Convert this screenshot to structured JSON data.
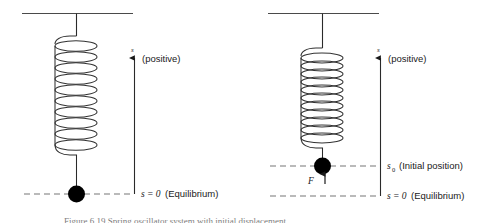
{
  "figure": {
    "background_color": "#ffffff",
    "line_color": "#1a1a1a",
    "spring_color": "#333333",
    "ceiling_color": "#555555",
    "dash_color": "#777777",
    "ball_color": "#000000",
    "caption": "Figure 6.19  Spring oscillator system with initial displacement"
  },
  "panels": [
    {
      "id": "left-panel",
      "name": "equilibrium-panel",
      "ceiling_label": "ceiling-support",
      "spring_state": "relaxed",
      "coil_count": 10,
      "axis": {
        "symbol": "s",
        "direction_label": "(positive)"
      },
      "reference_lines": [
        {
          "id": "equilibrium-line",
          "symbol": "s = 0",
          "description": "(Equilibrium)"
        }
      ],
      "mass": {
        "name": "mass-ball",
        "position": "equilibrium"
      },
      "force": null
    },
    {
      "id": "right-panel",
      "name": "displaced-panel",
      "ceiling_label": "ceiling-support",
      "spring_state": "compressed",
      "coil_count": 11,
      "axis": {
        "symbol": "s",
        "direction_label": "(positive)"
      },
      "reference_lines": [
        {
          "id": "initial-position-line",
          "symbol": "s",
          "subscript": "0",
          "description": "(Initial position)"
        },
        {
          "id": "equilibrium-line",
          "symbol": "s = 0",
          "description": "(Equilibrium)"
        }
      ],
      "mass": {
        "name": "mass-ball",
        "position": "initial-position"
      },
      "force": {
        "symbol": "F",
        "direction": "down"
      }
    }
  ]
}
